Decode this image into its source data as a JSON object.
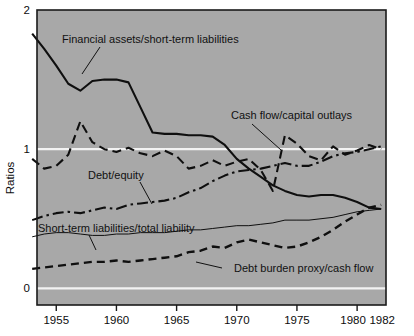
{
  "figure": {
    "background": "#a8a8a8",
    "page_background": "#ffffff",
    "axis_color": "#1a1a1a",
    "gridline_color": "#f2f2f2",
    "ylabel": "Ratios"
  },
  "chart_data": {
    "type": "line",
    "title": "",
    "xlabel": "",
    "ylabel": "Ratios",
    "xlim": [
      1953.4,
      1982.4
    ],
    "ylim": [
      -0.12,
      2.0
    ],
    "yticks": [
      0,
      1,
      2
    ],
    "ytick_labels": [
      "0",
      "1",
      "2"
    ],
    "xticks": [
      1955,
      1960,
      1965,
      1970,
      1975,
      1980,
      1982
    ],
    "xtick_labels": [
      "1955",
      "1960",
      "1965",
      "1970",
      "1975",
      "1980",
      "1982"
    ],
    "grid": "horizontal-at-0-and-1",
    "legend": "inline-annotations",
    "annotations": [
      {
        "text": "Financial assets/short-term liabilities",
        "series": "financial_assets_over_short_term_liabilities",
        "text_x": 62,
        "text_y": 43,
        "leader": [
          [
            100,
            47
          ],
          [
            82,
            74
          ]
        ]
      },
      {
        "text": "Cash flow/capital outlays",
        "series": "cash_flow_over_capital_outlays",
        "text_x": 231,
        "text_y": 119,
        "leader": [
          [
            252,
            124
          ],
          [
            281,
            150
          ]
        ]
      },
      {
        "text": "Debt/equity",
        "series": "debt_over_equity",
        "text_x": 88,
        "text_y": 179,
        "leader": [
          [
            140,
            182
          ],
          [
            152,
            204
          ]
        ]
      },
      {
        "text": "Short-term liabilities/total liability",
        "series": "short_term_liabilities_over_total_liability",
        "text_x": 38,
        "text_y": 232,
        "leader": [
          [
            89,
            235
          ],
          [
            96,
            250
          ]
        ]
      },
      {
        "text": "Debt burden proxy/cash flow",
        "series": "debt_burden_proxy_over_cash_flow",
        "text_x": 234,
        "text_y": 272,
        "leader": [
          [
            222,
            268
          ],
          [
            196,
            262
          ]
        ]
      }
    ],
    "x": [
      1953,
      1954,
      1955,
      1956,
      1957,
      1958,
      1959,
      1960,
      1961,
      1962,
      1963,
      1964,
      1965,
      1966,
      1967,
      1968,
      1969,
      1970,
      1971,
      1972,
      1973,
      1974,
      1975,
      1976,
      1977,
      1978,
      1979,
      1980,
      1981,
      1982
    ],
    "series": [
      {
        "name": "financial_assets_over_short_term_liabilities",
        "label": "Financial assets/short-term liabilities",
        "style": "solid-thick",
        "linewidth": 2.1,
        "color": "#0f0f0f",
        "values": [
          1.83,
          1.72,
          1.6,
          1.47,
          1.42,
          1.49,
          1.5,
          1.5,
          1.48,
          1.3,
          1.12,
          1.11,
          1.11,
          1.1,
          1.1,
          1.09,
          1.03,
          0.93,
          0.86,
          0.8,
          0.74,
          0.7,
          0.67,
          0.66,
          0.67,
          0.67,
          0.65,
          0.62,
          0.58,
          0.57
        ]
      },
      {
        "name": "cash_flow_over_capital_outlays",
        "label": "Cash flow/capital outlays",
        "style": "dashed",
        "linewidth": 2.1,
        "color": "#0f0f0f",
        "values": [
          0.93,
          0.86,
          0.88,
          0.96,
          1.2,
          1.05,
          1.0,
          0.98,
          1.01,
          0.97,
          0.95,
          0.99,
          0.95,
          0.86,
          0.88,
          0.92,
          0.88,
          0.91,
          0.93,
          0.85,
          0.7,
          1.1,
          1.04,
          0.95,
          0.92,
          1.02,
          0.96,
          0.99,
          1.03,
          1.0
        ]
      },
      {
        "name": "debt_over_equity",
        "label": "Debt/equity",
        "style": "dash-dot",
        "linewidth": 2.1,
        "color": "#0f0f0f",
        "values": [
          0.49,
          0.52,
          0.54,
          0.55,
          0.54,
          0.56,
          0.58,
          0.57,
          0.6,
          0.61,
          0.62,
          0.63,
          0.65,
          0.69,
          0.72,
          0.77,
          0.81,
          0.84,
          0.85,
          0.86,
          0.88,
          0.9,
          0.88,
          0.88,
          0.91,
          0.95,
          0.97,
          0.98,
          1.0,
          1.02
        ]
      },
      {
        "name": "short_term_liabilities_over_total_liability",
        "label": "Short-term liabilities/total liability",
        "style": "solid-thin",
        "linewidth": 1.0,
        "color": "#0f0f0f",
        "values": [
          0.37,
          0.39,
          0.4,
          0.4,
          0.39,
          0.38,
          0.38,
          0.39,
          0.39,
          0.4,
          0.4,
          0.4,
          0.41,
          0.42,
          0.42,
          0.43,
          0.44,
          0.45,
          0.45,
          0.46,
          0.47,
          0.49,
          0.49,
          0.49,
          0.5,
          0.51,
          0.53,
          0.55,
          0.56,
          0.57
        ]
      },
      {
        "name": "debt_burden_proxy_over_cash_flow",
        "label": "Debt burden proxy/cash flow",
        "style": "dashed-heavy",
        "linewidth": 2.4,
        "color": "#0f0f0f",
        "values": [
          0.14,
          0.15,
          0.16,
          0.17,
          0.18,
          0.19,
          0.19,
          0.2,
          0.19,
          0.2,
          0.21,
          0.22,
          0.23,
          0.26,
          0.27,
          0.3,
          0.29,
          0.33,
          0.35,
          0.33,
          0.31,
          0.29,
          0.3,
          0.33,
          0.37,
          0.42,
          0.48,
          0.53,
          0.58,
          0.6
        ]
      }
    ]
  }
}
